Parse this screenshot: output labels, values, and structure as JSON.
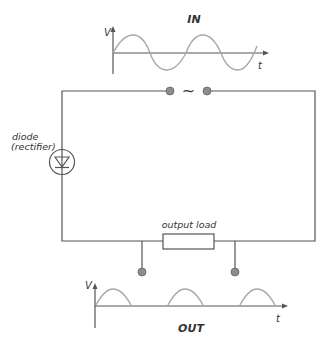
{
  "diagram": {
    "type": "half-wave rectifier circuit",
    "input_graph": {
      "title": "IN",
      "y_axis_label": "V",
      "x_axis_label": "t",
      "waveform": "sine"
    },
    "output_graph": {
      "title": "OUT",
      "y_axis_label": "V",
      "x_axis_label": "t",
      "waveform": "half-wave rectified"
    },
    "components": {
      "ac_source_symbol": "~",
      "diode_label_line1": "diode",
      "diode_label_line2": "(rectifier)",
      "load_label": "output load"
    },
    "colors": {
      "wire": "#555555",
      "wave": "#a8a8a8",
      "terminal": "#8c8c8c",
      "text": "#333333"
    }
  }
}
